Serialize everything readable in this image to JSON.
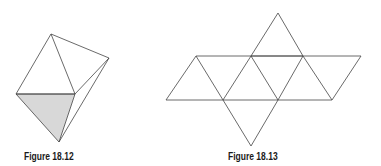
{
  "figures": [
    {
      "caption": "Figure 18.12",
      "description": "Octahedron in perspective with one shaded face",
      "stroke": "#444444",
      "shade": "#d8d8d8",
      "vertices": {
        "top": [
          51,
          34
        ],
        "right": [
          109,
          58
        ],
        "left": [
          16,
          94
        ],
        "middle": [
          75,
          94
        ],
        "bottom": [
          59,
          142
        ]
      }
    },
    {
      "caption": "Figure 18.13",
      "description": "Net of an octahedron: eight equilateral triangles",
      "stroke": "#444444",
      "vertices": {
        "top_apex": [
          278,
          13
        ],
        "upper_row": [
          [
            196,
            56
          ],
          [
            251,
            56
          ],
          [
            303,
            56
          ],
          [
            361,
            56
          ]
        ],
        "lower_row": [
          [
            166,
            100
          ],
          [
            223,
            100
          ],
          [
            278,
            100
          ],
          [
            332,
            100
          ]
        ],
        "bottom_apex": [
          251,
          146
        ]
      }
    }
  ]
}
